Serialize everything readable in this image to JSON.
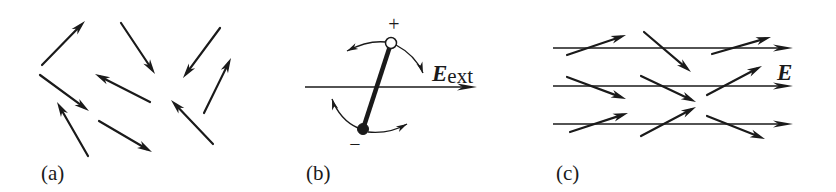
{
  "figure": {
    "ink_color": "#1a1a1a",
    "background": "#ffffff",
    "panels": [
      {
        "id": "a",
        "label": "(a)",
        "label_pos": [
          41,
          180
        ],
        "description": "Randomly oriented dipoles (no external field)",
        "arrows": [
          {
            "from": [
              42,
              65
            ],
            "to": [
              85,
              21
            ]
          },
          {
            "from": [
              121,
              23
            ],
            "to": [
              155,
              74
            ]
          },
          {
            "from": [
              220,
              28
            ],
            "to": [
              183,
              78
            ]
          },
          {
            "from": [
              204,
              113
            ],
            "to": [
              231,
              58
            ]
          },
          {
            "from": [
              40,
              75
            ],
            "to": [
              89,
              111
            ]
          },
          {
            "from": [
              150,
              102
            ],
            "to": [
              95,
              74
            ]
          },
          {
            "from": [
              213,
              144
            ],
            "to": [
              171,
              100
            ]
          },
          {
            "from": [
              88,
              156
            ],
            "to": [
              57,
              102
            ]
          },
          {
            "from": [
              99,
              121
            ],
            "to": [
              152,
              152
            ]
          }
        ]
      },
      {
        "id": "b",
        "label": "(b)",
        "label_pos": [
          306,
          180
        ],
        "description": "Single dipole rotating in external field",
        "field_line": {
          "from": [
            305,
            87
          ],
          "to": [
            477,
            87
          ]
        },
        "field_label": "E",
        "field_label_sub": "ext",
        "field_label_pos": [
          432,
          81
        ],
        "positive_charge": {
          "center": [
            391,
            43
          ],
          "r": 5.5,
          "sign": "+",
          "sign_pos": [
            394,
            31
          ]
        },
        "negative_charge": {
          "center": [
            363,
            129
          ],
          "r": 5.5,
          "sign": "−",
          "sign_pos": [
            355,
            151
          ]
        },
        "rotation_arrows": [
          {
            "path": "M 386 42 Q 368 40 347 51",
            "head_at": [
              347,
              51
            ],
            "dir": [
              -1,
              0.5
            ]
          },
          {
            "path": "M 396 45 Q 415 55 423 73",
            "head_at": [
              423,
              73
            ],
            "dir": [
              0.35,
              1
            ]
          },
          {
            "path": "M 358 128 Q 340 120 332 99",
            "head_at": [
              332,
              99
            ],
            "dir": [
              -0.3,
              -1
            ]
          },
          {
            "path": "M 368 132 Q 390 134 407 124",
            "head_at": [
              407,
              124
            ],
            "dir": [
              1,
              -0.55
            ]
          }
        ]
      },
      {
        "id": "c",
        "label": "(c)",
        "label_pos": [
          556,
          180
        ],
        "description": "Dipoles partially aligned with field E",
        "field_label": "E",
        "field_label_pos": [
          777,
          80
        ],
        "field_lines": [
          {
            "from": [
              553,
              48
            ],
            "to": [
              793,
              48
            ]
          },
          {
            "from": [
              553,
              86
            ],
            "to": [
              793,
              86
            ]
          },
          {
            "from": [
              553,
              124
            ],
            "to": [
              793,
              124
            ]
          }
        ],
        "arrows": [
          {
            "from": [
              567,
              55
            ],
            "to": [
              626,
              35
            ]
          },
          {
            "from": [
              644,
              32
            ],
            "to": [
              691,
              72
            ]
          },
          {
            "from": [
              712,
              54
            ],
            "to": [
              771,
              37
            ]
          },
          {
            "from": [
              567,
              77
            ],
            "to": [
              626,
              99
            ]
          },
          {
            "from": [
              641,
              76
            ],
            "to": [
              696,
              102
            ]
          },
          {
            "from": [
              707,
              95
            ],
            "to": [
              762,
              66
            ]
          },
          {
            "from": [
              570,
              132
            ],
            "to": [
              628,
              113
            ]
          },
          {
            "from": [
              641,
              136
            ],
            "to": [
              696,
              107
            ]
          },
          {
            "from": [
              707,
              116
            ],
            "to": [
              765,
              139
            ]
          }
        ]
      }
    ]
  }
}
